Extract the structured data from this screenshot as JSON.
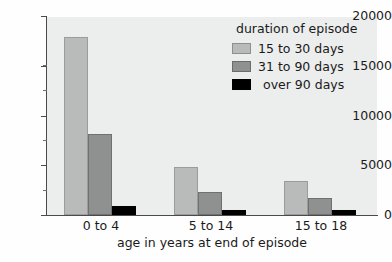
{
  "chart_data": {
    "type": "bar",
    "title": "",
    "subtitle": "",
    "xlabel": "age in years at end of episode",
    "ylabel": "",
    "categories": [
      "0 to 4",
      "5 to 14",
      "15 to 18"
    ],
    "series": [
      {
        "name": "15 to 30 days",
        "color": "#b9bbba",
        "values": [
          18000,
          4800,
          3400
        ]
      },
      {
        "name": "31 to 90 days",
        "color": "#8f9190",
        "values": [
          8200,
          2300,
          1750
        ]
      },
      {
        "name": "over 90 days",
        "color": "#000000",
        "values": [
          950,
          550,
          500
        ]
      }
    ],
    "ylim": [
      0,
      20000
    ],
    "yticks": [
      0,
      5000,
      10000,
      15000,
      20000
    ],
    "ytick_labels": [
      "0",
      "5000",
      "10000",
      "15000",
      "20000"
    ],
    "yminor_ticks": [
      2500,
      7500,
      12500,
      17500
    ],
    "grid": false,
    "legend_position": "top-right",
    "legend_title": "duration of episode",
    "plot_background": "#eceded",
    "axis_color": "#4a4a4a"
  },
  "legend": {
    "title": "duration of episode",
    "entries": [
      {
        "label": "15 to 30 days"
      },
      {
        "label": "31 to 90 days"
      },
      {
        "label": "over 90 days"
      }
    ]
  },
  "axes": {
    "x": {
      "title": "age in years at end of episode",
      "labels": [
        "0 to 4",
        "5 to 14",
        "15 to 18"
      ]
    },
    "y": {
      "labels": [
        "20000",
        "15000",
        "10000",
        "5000",
        "0"
      ]
    }
  }
}
